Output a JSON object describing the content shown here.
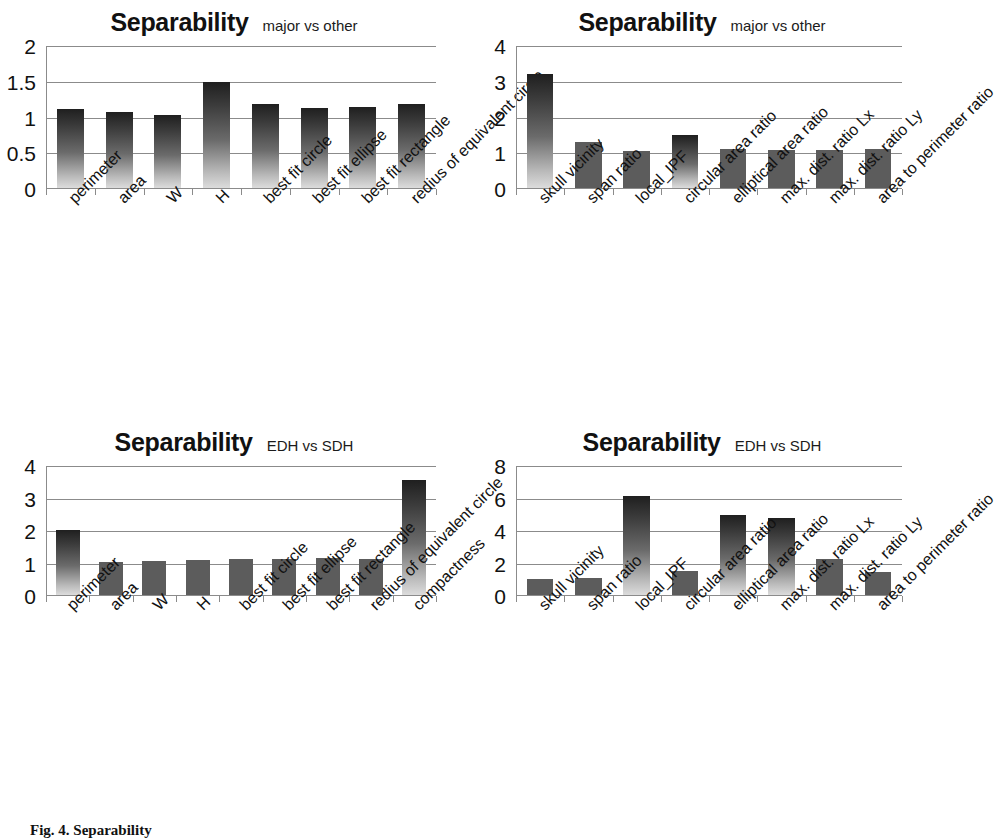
{
  "figure": {
    "caption": "Fig. 4. Separability"
  },
  "charts": [
    {
      "id": "major-vs-other-shape",
      "position": "top-left",
      "title": "Separability",
      "subtitle": "major vs other",
      "chart_data": {
        "type": "bar",
        "title": "Separability",
        "subtitle": "major vs other",
        "xlabel": "",
        "ylabel": "",
        "ylim": [
          0,
          2
        ],
        "yticks": [
          "0",
          "0.5",
          "1",
          "1.5",
          "2"
        ],
        "ytick_values": [
          0,
          0.5,
          1,
          1.5,
          2
        ],
        "grid": true,
        "legend": "none",
        "categories": [
          "perimeter",
          "area",
          "W",
          "H",
          "best fit circle",
          "best fit ellipse",
          "best fit rectangle",
          "redius of equivalent circle"
        ],
        "values": [
          1.1,
          1.07,
          1.02,
          1.48,
          1.18,
          1.12,
          1.13,
          1.17
        ]
      }
    },
    {
      "id": "major-vs-other-ratio",
      "position": "top-right",
      "title": "Separability",
      "subtitle": "major vs other",
      "chart_data": {
        "type": "bar",
        "title": "Separability",
        "subtitle": "major vs other",
        "xlabel": "",
        "ylabel": "",
        "ylim": [
          0,
          4
        ],
        "yticks": [
          "0",
          "1",
          "2",
          "3",
          "4"
        ],
        "ytick_values": [
          0,
          1,
          2,
          3,
          4
        ],
        "grid": true,
        "legend": "none",
        "categories": [
          "skull vicinity",
          "span ratio",
          "local_IPF",
          "circular area ratio",
          "elliptical area ratio",
          "max. dist. ratio Lx",
          "max. dist. ratio Ly",
          "area to perimeter ratio"
        ],
        "values": [
          3.2,
          1.28,
          1.03,
          1.48,
          1.08,
          1.07,
          1.07,
          1.1
        ]
      }
    },
    {
      "id": "edh-vs-sdh-shape",
      "position": "bottom-left",
      "title": "Separability",
      "subtitle": "EDH vs SDH",
      "chart_data": {
        "type": "bar",
        "title": "Separability",
        "subtitle": "EDH vs SDH",
        "xlabel": "",
        "ylabel": "",
        "ylim": [
          0,
          4
        ],
        "yticks": [
          "0",
          "1",
          "2",
          "3",
          "4"
        ],
        "ytick_values": [
          0,
          1,
          2,
          3,
          4
        ],
        "grid": true,
        "legend": "none",
        "categories": [
          "perimeter",
          "area",
          "W",
          "H",
          "best fit circle",
          "best fit ellipse",
          "best fit rectangle",
          "redius of equivalent circle",
          "compactness"
        ],
        "values": [
          2.0,
          1.02,
          1.05,
          1.08,
          1.12,
          1.12,
          1.13,
          1.1,
          3.55
        ]
      }
    },
    {
      "id": "edh-vs-sdh-ratio",
      "position": "bottom-right",
      "title": "Separability",
      "subtitle": "EDH vs SDH",
      "chart_data": {
        "type": "bar",
        "title": "Separability",
        "subtitle": "EDH vs SDH",
        "xlabel": "",
        "ylabel": "",
        "ylim": [
          0,
          8
        ],
        "yticks": [
          "0",
          "2",
          "4",
          "6",
          "8"
        ],
        "ytick_values": [
          0,
          2,
          4,
          6,
          8
        ],
        "grid": true,
        "legend": "none",
        "categories": [
          "skull vicinity",
          "span ratio",
          "local_IPF",
          "circular area ratio",
          "elliptical area ratio",
          "max. dist. ratio Lx",
          "max. dist. ratio Ly",
          "area to perimeter ratio"
        ],
        "values": [
          1.0,
          1.07,
          6.1,
          1.5,
          4.9,
          4.75,
          2.2,
          1.4
        ]
      }
    }
  ],
  "colors": {
    "bar_solid": "#5c5c5c",
    "gradient_top": "#1f1f1f",
    "gradient_bottom": "#dcdcdc",
    "axis": "#8b8b8b",
    "text": "#111111",
    "background": "#ffffff"
  }
}
